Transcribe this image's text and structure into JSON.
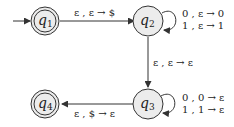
{
  "diagram": {
    "type": "pushdown-automaton",
    "states": [
      {
        "id": "q1",
        "name": "q",
        "sub": "1",
        "start": true,
        "accept": true
      },
      {
        "id": "q2",
        "name": "q",
        "sub": "2",
        "start": false,
        "accept": false
      },
      {
        "id": "q3",
        "name": "q",
        "sub": "3",
        "start": false,
        "accept": false
      },
      {
        "id": "q4",
        "name": "q",
        "sub": "4",
        "start": false,
        "accept": true
      }
    ],
    "transitions": [
      {
        "from": "q1",
        "to": "q2",
        "label": "ε , ε → $"
      },
      {
        "from": "q2",
        "to": "q2",
        "labels": [
          "0 , ε → 0",
          "1 , ε → 1"
        ]
      },
      {
        "from": "q2",
        "to": "q3",
        "label": "ε , ε → ε"
      },
      {
        "from": "q3",
        "to": "q3",
        "labels": [
          "0 , 0 → ε",
          "1 , 1 → ε"
        ]
      },
      {
        "from": "q3",
        "to": "q4",
        "label": "ε , $ → ε"
      }
    ]
  }
}
